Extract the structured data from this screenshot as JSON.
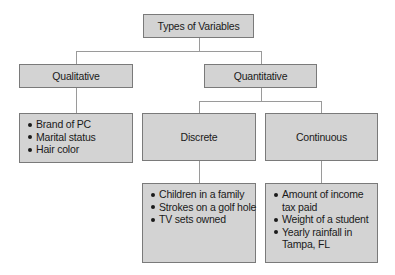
{
  "diagram": {
    "root": {
      "label": "Types of Variables"
    },
    "qualitative": {
      "label": "Qualitative",
      "examples": [
        "Brand of PC",
        "Marital status",
        "Hair color"
      ]
    },
    "quantitative": {
      "label": "Quantitative",
      "discrete": {
        "label": "Discrete",
        "examples": [
          "Children in a family",
          "Strokes on a golf hole",
          "TV sets owned"
        ]
      },
      "continuous": {
        "label": "Continuous",
        "examples": [
          "Amount of income",
          "tax paid",
          "Weight of a student",
          "Yearly rainfall in",
          "Tampa, FL"
        ]
      }
    }
  },
  "colors": {
    "box_fill": "#d3d3d3",
    "box_border": "#7a7a7a",
    "connector": "#9a9a9a",
    "text": "#1a1a1a"
  }
}
